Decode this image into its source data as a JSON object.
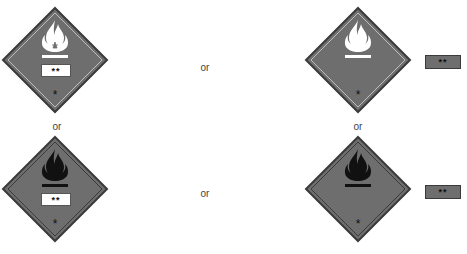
{
  "figure": {
    "fill_color": "#6e6e6e",
    "border_color": "#3a3a3a",
    "inner_line_color": "#bdbdbd",
    "variants": [
      {
        "position": "top-left",
        "symbol": "flame",
        "symbol_color": "#ffffff",
        "inline_label": "**",
        "bottom_mark": "*"
      },
      {
        "position": "top-right",
        "symbol": "flame",
        "symbol_color": "#ffffff",
        "inline_label": null,
        "bottom_mark": "*",
        "external_label": "**"
      },
      {
        "position": "bottom-left",
        "symbol": "flame",
        "symbol_color": "#111111",
        "inline_label": "**",
        "bottom_mark": "*"
      },
      {
        "position": "bottom-right",
        "symbol": "flame",
        "symbol_color": "#111111",
        "inline_label": null,
        "bottom_mark": "*",
        "external_label": "**"
      }
    ]
  },
  "connectors": {
    "or_top_middle": "or",
    "or_bottom_middle": "or",
    "or_left_vertical": "or",
    "or_right_vertical": "or"
  },
  "labels": {
    "sign1_inline": "**",
    "sign1_mark": "*",
    "sign2_mark": "*",
    "sign2_external": "**",
    "sign3_inline": "**",
    "sign3_mark": "*",
    "sign4_mark": "*",
    "sign4_external": "**"
  }
}
